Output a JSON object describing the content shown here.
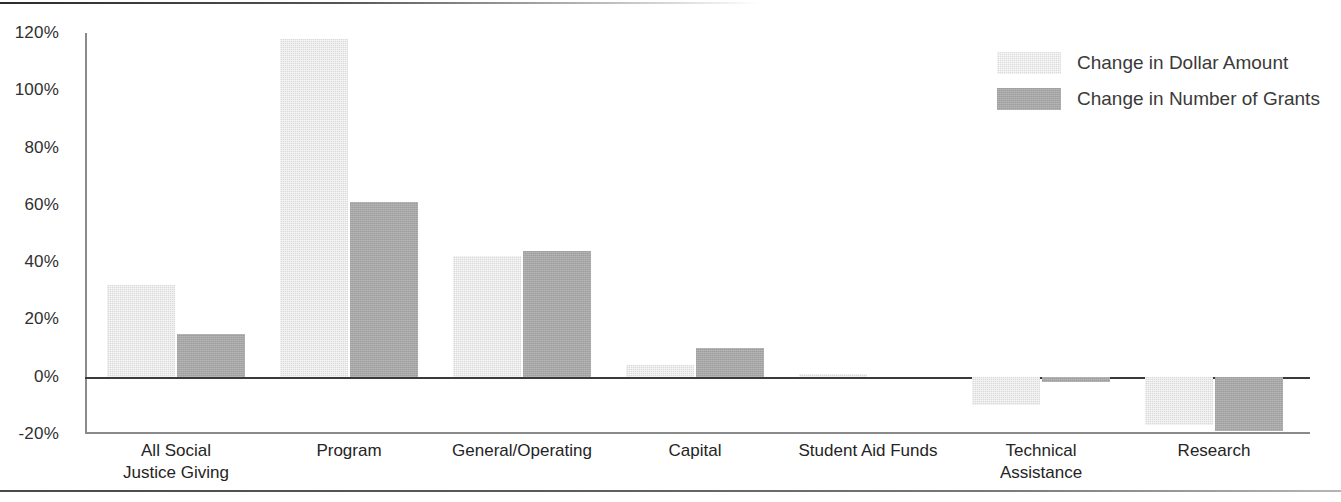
{
  "chart_data": {
    "type": "bar",
    "title": "",
    "subtitle": "",
    "xlabel": "",
    "ylabel": "",
    "ylim": [
      -20,
      120
    ],
    "yticks": [
      -20,
      0,
      20,
      40,
      60,
      80,
      100,
      120
    ],
    "ytick_labels": [
      "-20%",
      "0%",
      "20%",
      "40%",
      "60%",
      "80%",
      "100%",
      "120%"
    ],
    "grid": false,
    "legend_position": "top-right",
    "categories": [
      "All Social\nJustice Giving",
      "Program",
      "General/Operating",
      "Capital",
      "Student Aid Funds",
      "Technical\nAssistance",
      "Research"
    ],
    "series": [
      {
        "name": "Change in Dollar Amount",
        "color": "#d9d9d9",
        "values": [
          32,
          118,
          42,
          4,
          1,
          -10,
          -17
        ]
      },
      {
        "name": "Change in Number of Grants",
        "color": "#a6a6a6",
        "values": [
          15,
          61,
          44,
          10,
          0,
          -2,
          -19
        ]
      }
    ]
  },
  "legend": {
    "items": [
      {
        "label": "Change in Dollar Amount",
        "swatch": "light"
      },
      {
        "label": "Change in Number of Grants",
        "swatch": "dark"
      }
    ]
  },
  "axis": {
    "y_labels": [
      "120%",
      "100%",
      "80%",
      "60%",
      "40%",
      "20%",
      "0%",
      "-20%"
    ]
  }
}
